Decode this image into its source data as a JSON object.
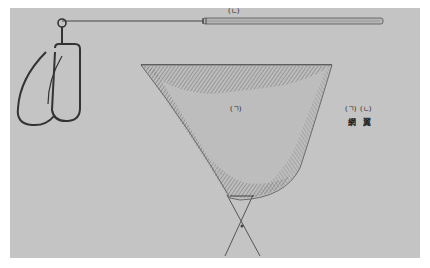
{
  "figure": {
    "labels": {
      "pole_marker": "(ㄴ)",
      "net_marker": "(ㄱ)",
      "legend": [
        {
          "marker": "(ㄱ)",
          "term": "網"
        },
        {
          "marker": "(ㄴ)",
          "term": "翼"
        }
      ]
    },
    "colors": {
      "background": "#c4c4c4",
      "ink": "#3a3a3a",
      "net_shade": "#8a8a8a"
    }
  }
}
